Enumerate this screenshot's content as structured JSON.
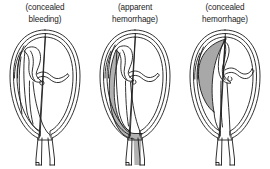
{
  "figure": {
    "background_color": "#ffffff",
    "ink_color": "#1b1b1b",
    "blood_shade_color": "#b2b2b2",
    "blood_shade_color_dark": "#a8a8a8",
    "panels": [
      {
        "id": "panel-1",
        "caption": "(concealed\nbleeding)",
        "caption_line_1": "(concealed",
        "caption_line_2": "bleeding)",
        "bleeding_type": "concealed",
        "shading_visible": "false",
        "anatomy": [
          "uterus-wall",
          "placenta",
          "umbilical-cord",
          "fetal-membrane",
          "cervix"
        ]
      },
      {
        "id": "panel-2",
        "caption": "(apparent\nhemorrhage)",
        "caption_line_1": "(apparent",
        "caption_line_2": "hemorrhage)",
        "bleeding_type": "apparent",
        "shading_visible": "true",
        "blood_path": "lateral-wall-to-cervix-external",
        "anatomy": [
          "uterus-wall",
          "placenta",
          "umbilical-cord",
          "fetal-membrane",
          "cervix",
          "blood-stream"
        ]
      },
      {
        "id": "panel-3",
        "caption": "(concealed\nhemorrhage)",
        "caption_line_1": "(concealed",
        "caption_line_2": "hemorrhage)",
        "bleeding_type": "concealed",
        "shading_visible": "true",
        "blood_path": "retroplacental-pooled",
        "anatomy": [
          "uterus-wall",
          "placenta",
          "umbilical-cord",
          "fetal-membrane",
          "cervix",
          "blood-clot"
        ]
      }
    ]
  }
}
